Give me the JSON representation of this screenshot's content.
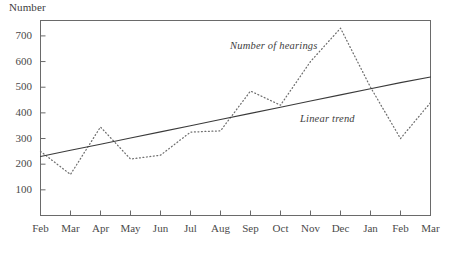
{
  "chart_data": {
    "type": "line",
    "title": "",
    "subtitle": "",
    "ylabel": "Number",
    "xlabel": "",
    "categories": [
      "Feb",
      "Mar",
      "Apr",
      "May",
      "Jun",
      "Jul",
      "Aug",
      "Sep",
      "Oct",
      "Nov",
      "Dec",
      "Jan",
      "Feb",
      "Mar"
    ],
    "ytick_labels": [
      "100",
      "200",
      "300",
      "400",
      "500",
      "600",
      "700"
    ],
    "yticks": [
      100,
      200,
      300,
      400,
      500,
      600,
      700
    ],
    "ylim": [
      0,
      760
    ],
    "grid": false,
    "legend_position": "inline-annotation",
    "series": [
      {
        "name": "Number of hearings",
        "style": "dotted",
        "color": "#6e6e6e",
        "values": [
          250,
          160,
          345,
          220,
          235,
          325,
          330,
          485,
          430,
          600,
          730,
          500,
          300,
          440
        ]
      },
      {
        "name": "Linear trend",
        "style": "solid",
        "color": "#3a3a3a",
        "values": [
          230,
          254,
          278,
          302,
          326,
          350,
          374,
          398,
          422,
          446,
          470,
          494,
          518,
          540
        ]
      }
    ],
    "annotations": [
      {
        "text": "Number of hearings",
        "x": 230,
        "y": 40
      },
      {
        "text": "Linear trend",
        "x": 300,
        "y": 113
      }
    ],
    "axis_color": "#6a6a6a",
    "text_color": "#4a4a4a"
  }
}
